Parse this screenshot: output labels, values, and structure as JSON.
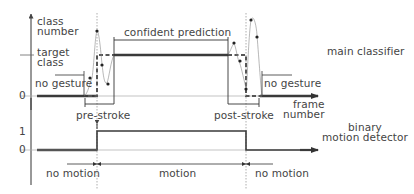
{
  "upper_plot": {
    "y_axis_label_line1": "class",
    "y_axis_label_line2": "number",
    "target_label_line1": "target",
    "target_label_line2": "class",
    "zero_tick": "0",
    "x_axis_label_line1": "frame",
    "x_axis_label_line2": "number",
    "no_gesture_left": "no gesture",
    "no_gesture_right": "no gesture",
    "confident_prediction": "confident prediction",
    "pre_stroke": "pre-stroke",
    "post_stroke": "post-stroke",
    "title": "main classifier"
  },
  "lower_plot": {
    "one_tick": "1",
    "zero_tick": "0",
    "title_line1": "binary",
    "title_line2": "motion detector",
    "no_motion_left": "no motion",
    "motion": "motion",
    "no_motion_right": "no motion"
  },
  "colors": {
    "line": "#333333",
    "thick": "#3a3a3a",
    "dashed": "#666666",
    "guide": "#999999",
    "text": "#444444"
  }
}
